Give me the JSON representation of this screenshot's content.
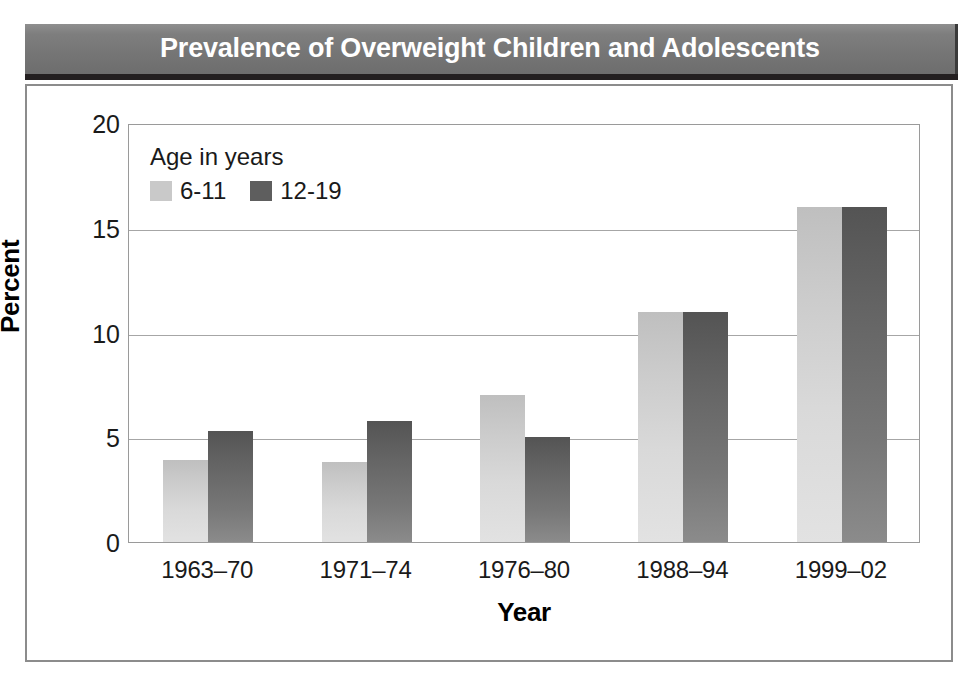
{
  "banner": {
    "title": "Prevalence of Overweight Children and Adolescents",
    "background_color": "#757575",
    "text_color": "#ffffff"
  },
  "legend": {
    "title": "Age in years",
    "entries": [
      {
        "label": "6-11",
        "color": "#c9c9c9"
      },
      {
        "label": "12-19",
        "color": "#5e5e5e"
      }
    ]
  },
  "axes": {
    "y_title": "Percent",
    "x_title": "Year",
    "y_ticks": [
      "0",
      "5",
      "10",
      "15",
      "20"
    ]
  },
  "chart_data": {
    "type": "bar",
    "title": "Prevalence of Overweight Children and Adolescents",
    "xlabel": "Year",
    "ylabel": "Percent",
    "ylim": [
      0,
      20
    ],
    "ytick_values": [
      0,
      5,
      10,
      15,
      20
    ],
    "grid": true,
    "legend_position": "upper-left-inside",
    "legend_title": "Age in years",
    "categories": [
      "1963–70",
      "1971–74",
      "1976–80",
      "1988–94",
      "1999–02"
    ],
    "series": [
      {
        "name": "6-11",
        "color": "#c9c9c9",
        "values": [
          3.9,
          3.8,
          7.0,
          11.0,
          16.0
        ]
      },
      {
        "name": "12-19",
        "color": "#5e5e5e",
        "values": [
          5.3,
          5.8,
          5.0,
          11.0,
          16.0
        ]
      }
    ]
  }
}
